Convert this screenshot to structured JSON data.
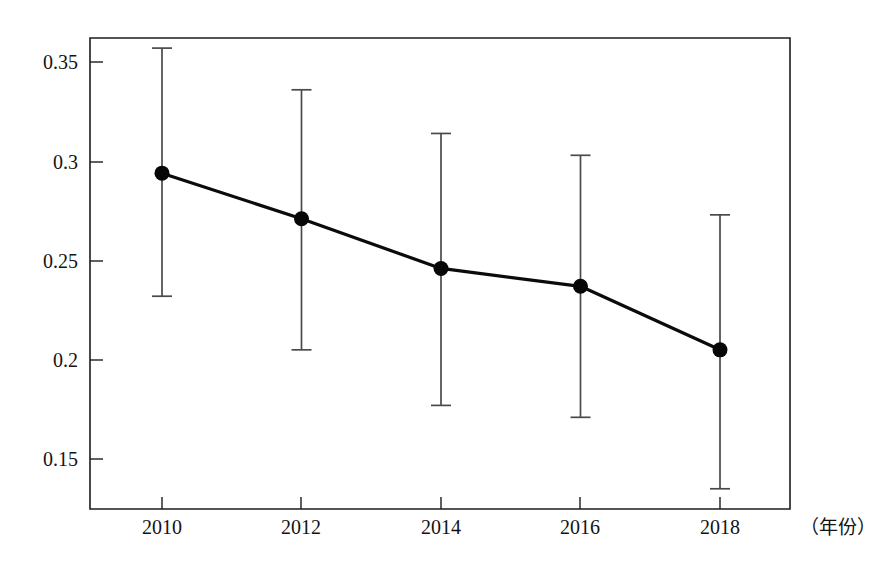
{
  "chart_data": {
    "type": "line",
    "title": "",
    "subtitle": "",
    "xlabel": "（年份）",
    "ylabel": "",
    "x": [
      2010,
      2012,
      2014,
      2016,
      2018
    ],
    "categories": [
      "2010",
      "2012",
      "2014",
      "2016",
      "2018"
    ],
    "values": [
      0.294,
      0.271,
      0.246,
      0.237,
      0.205
    ],
    "error_upper": [
      0.357,
      0.336,
      0.314,
      0.303,
      0.273
    ],
    "error_lower": [
      0.232,
      0.205,
      0.177,
      0.171,
      0.135
    ],
    "series": [
      {
        "name": "series-1",
        "values": [
          0.294,
          0.271,
          0.246,
          0.237,
          0.205
        ],
        "error_upper": [
          0.357,
          0.336,
          0.314,
          0.303,
          0.273
        ],
        "error_lower": [
          0.232,
          0.205,
          0.177,
          0.171,
          0.135
        ]
      }
    ],
    "xlim": [
      2009.2,
      2018.9
    ],
    "ylim": [
      0.119,
      0.362
    ],
    "yticks": [
      0.15,
      0.2,
      0.25,
      0.3,
      0.35
    ],
    "ytick_labels": [
      "0.15",
      "0.2",
      "0.25",
      "0.3",
      "0.35"
    ],
    "xticks": [
      2010,
      2012,
      2014,
      2016,
      2018
    ],
    "xtick_labels": [
      "2010",
      "2012",
      "2014",
      "2016",
      "2018"
    ],
    "grid": false,
    "legend": "none",
    "marker": "filled-circle",
    "errorbars": "capped-vertical",
    "colors": {
      "line": "#0b0b0b",
      "marker": "#070707",
      "errorbar": "#4a4a4a",
      "axis": "#1c1c1c",
      "background": "#ffffff",
      "text": "#131313"
    }
  },
  "axes": {
    "y_tick_labels": [
      "0.35",
      "0.3",
      "0.25",
      "0.2",
      "0.15"
    ],
    "x_tick_labels": [
      "2010",
      "2012",
      "2014",
      "2016",
      "2018"
    ],
    "x_axis_caption": "（年份）"
  }
}
